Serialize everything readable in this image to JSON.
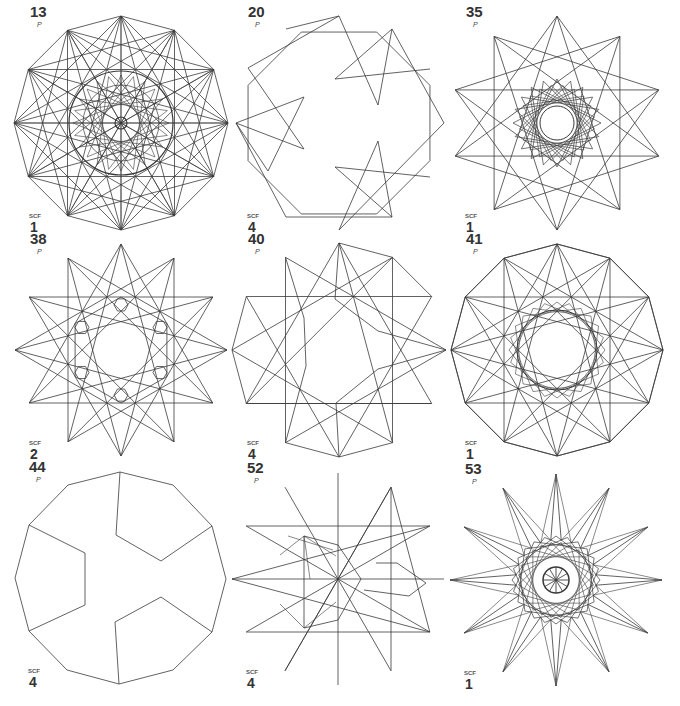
{
  "stroke_color": "#3a3a3a",
  "figures": [
    {
      "id": "13",
      "p_label": "P",
      "scf_label": "SCF",
      "scf": "1",
      "cx": 121,
      "cy": 123,
      "r": 107,
      "n": 12,
      "type": "dense",
      "steps": [
        1,
        3,
        4,
        5
      ]
    },
    {
      "id": "20",
      "p_label": "P",
      "scf_label": "SCF",
      "scf": "4",
      "cx": 339,
      "cy": 123,
      "r": 107,
      "n": 12,
      "type": "twenty"
    },
    {
      "id": "35",
      "p_label": "P",
      "scf_label": "SCF",
      "scf": "1",
      "cx": 557,
      "cy": 123,
      "r": 107,
      "n": 10,
      "type": "star35",
      "steps": [
        3,
        4
      ]
    },
    {
      "id": "38",
      "p_label": "P",
      "scf_label": "SCF",
      "scf": "2",
      "cx": 121,
      "cy": 350,
      "r": 106,
      "n": 12,
      "type": "star38",
      "steps": [
        4,
        5
      ]
    },
    {
      "id": "40",
      "p_label": "P",
      "scf_label": "SCF",
      "scf": "4",
      "cx": 339,
      "cy": 350,
      "r": 107,
      "n": 12,
      "type": "forty"
    },
    {
      "id": "41",
      "p_label": "P",
      "scf_label": "SCF",
      "scf": "1",
      "cx": 557,
      "cy": 350,
      "r": 106,
      "n": 12,
      "type": "dense41",
      "steps": [
        1,
        4,
        5
      ]
    },
    {
      "id": "44",
      "p_label": "P",
      "scf_label": "SCF",
      "scf": "4",
      "cx": 120,
      "cy": 578,
      "r": 106,
      "n": 12,
      "type": "fortyfour"
    },
    {
      "id": "52",
      "p_label": "P",
      "scf_label": "SCF",
      "scf": "4",
      "cx": 338,
      "cy": 579,
      "r": 106,
      "n": 12,
      "type": "fiftytwo"
    },
    {
      "id": "53",
      "p_label": "P",
      "scf_label": "SCF",
      "scf": "1",
      "cx": 556,
      "cy": 580,
      "r": 106,
      "n": 12,
      "type": "fiftythree"
    }
  ]
}
